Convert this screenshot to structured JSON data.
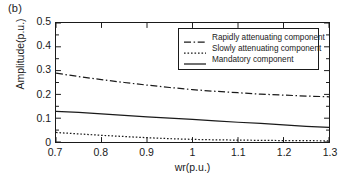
{
  "figure": {
    "panel_label": "(b)",
    "xlabel": "wr(p.u.)",
    "ylabel": "Amplitude(p.u.)"
  },
  "chart_data": {
    "type": "line",
    "title": "",
    "panel": "(b)",
    "xlabel": "wr(p.u.)",
    "ylabel": "Amplitude(p.u.)",
    "xlim": [
      0.7,
      1.3
    ],
    "ylim": [
      0,
      0.5
    ],
    "xticks": [
      0.7,
      0.8,
      0.9,
      1.0,
      1.1,
      1.2,
      1.3
    ],
    "xtick_labels": [
      "0.7",
      "0.8",
      "0.9",
      "1",
      "1.1",
      "1.2",
      "1.3"
    ],
    "yticks": [
      0,
      0.1,
      0.2,
      0.3,
      0.4,
      0.5
    ],
    "ytick_labels": [
      "0",
      "0.1",
      "0.2",
      "0.3",
      "0.4",
      "0.5"
    ],
    "minor_ticks": true,
    "grid": false,
    "legend_position": "upper right",
    "x": [
      0.7,
      0.75,
      0.8,
      0.85,
      0.9,
      0.95,
      1.0,
      1.05,
      1.1,
      1.15,
      1.2,
      1.25,
      1.3
    ],
    "series": [
      {
        "name": "Rapidly attenuating component",
        "style": "dashdot",
        "color": "#1a1a1a",
        "values": [
          0.289,
          0.275,
          0.262,
          0.25,
          0.239,
          0.229,
          0.22,
          0.213,
          0.207,
          0.201,
          0.197,
          0.193,
          0.19
        ]
      },
      {
        "name": "Slowly attenuating component",
        "style": "dotted",
        "color": "#1a1a1a",
        "values": [
          0.04,
          0.034,
          0.028,
          0.023,
          0.018,
          0.014,
          0.011,
          0.009,
          0.008,
          0.007,
          0.006,
          0.0055,
          0.005
        ]
      },
      {
        "name": "Mandatory component",
        "style": "solid",
        "color": "#1a1a1a",
        "values": [
          0.129,
          0.124,
          0.118,
          0.112,
          0.106,
          0.1,
          0.095,
          0.089,
          0.083,
          0.078,
          0.072,
          0.066,
          0.061
        ]
      }
    ]
  },
  "legend": {
    "items": [
      {
        "label": "Rapidly attenuating component",
        "style": "dashdot"
      },
      {
        "label": "Slowly attenuating component",
        "style": "dotted"
      },
      {
        "label": "Mandatory component",
        "style": "solid"
      }
    ]
  }
}
